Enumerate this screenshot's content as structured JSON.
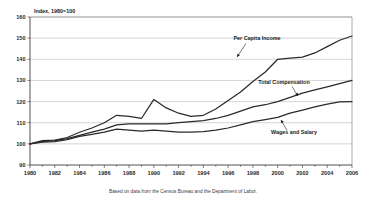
{
  "chart_data": {
    "type": "line",
    "title": "Index, 1980=100",
    "xlabel": "",
    "ylabel": "",
    "ylim": [
      90,
      160
    ],
    "xlim": [
      1980,
      2006
    ],
    "ytick_step": 10,
    "xtick_step": 2,
    "grid": true,
    "legend_position": "inline-annotations",
    "yticks": [
      "90",
      "100",
      "110",
      "120",
      "130",
      "140",
      "150",
      "160"
    ],
    "xticks": [
      "1980",
      "1982",
      "1984",
      "1986",
      "1988",
      "1990",
      "1992",
      "1994",
      "1996",
      "1998",
      "2000",
      "2002",
      "2004",
      "2006"
    ],
    "x": [
      1980,
      1981,
      1982,
      1983,
      1984,
      1985,
      1986,
      1987,
      1988,
      1989,
      1990,
      1991,
      1992,
      1993,
      1994,
      1995,
      1996,
      1997,
      1998,
      1999,
      2000,
      2001,
      2002,
      2003,
      2004,
      2005,
      2006
    ],
    "series": [
      {
        "name": "Per Capita Income",
        "values": [
          100.0,
          101.5,
          101.8,
          103.0,
          105.5,
          107.5,
          110.0,
          113.5,
          113.0,
          112.0,
          121.0,
          117.0,
          114.5,
          113.0,
          113.5,
          116.5,
          120.5,
          124.5,
          129.5,
          134.0,
          140.0,
          140.5,
          141.0,
          143.0,
          146.0,
          149.0,
          151.0
        ]
      },
      {
        "name": "Total Compensation",
        "values": [
          100.0,
          101.0,
          101.5,
          102.5,
          104.0,
          105.5,
          107.0,
          109.0,
          109.5,
          109.5,
          109.5,
          109.5,
          110.0,
          110.5,
          111.0,
          112.0,
          113.5,
          115.5,
          117.5,
          118.5,
          120.0,
          122.0,
          124.0,
          125.5,
          127.0,
          128.5,
          130.0
        ]
      },
      {
        "name": "Wages and Salary",
        "values": [
          100.0,
          100.8,
          101.0,
          102.0,
          103.5,
          104.5,
          105.5,
          107.0,
          106.5,
          106.0,
          106.5,
          106.0,
          105.5,
          105.5,
          105.8,
          106.5,
          107.5,
          109.0,
          110.5,
          111.5,
          112.5,
          114.5,
          116.0,
          117.5,
          118.8,
          119.8,
          120.0
        ]
      }
    ],
    "annotations": [
      {
        "text": "Per Capita Income",
        "series": "Per Capita Income"
      },
      {
        "text": "Total Compensation",
        "series": "Total Compensation"
      },
      {
        "text": "Wages and Salary",
        "series": "Wages and Salary"
      }
    ],
    "footnote": "Based on data from the Census Bureau and the Department of Labor."
  },
  "colors": {
    "line": "#2a2a2a",
    "grid": "#b9b9b9",
    "axis": "#3d3d3d",
    "text": "#1a1a1a",
    "background": "#ffffff"
  }
}
